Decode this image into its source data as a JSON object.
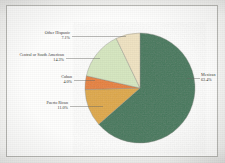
{
  "chart_data": {
    "type": "pie",
    "title": "",
    "subtitle": "",
    "xlabel": "",
    "ylabel": "",
    "legend_position": "none",
    "grid": false,
    "labels_show_percent": true,
    "categories": [
      "Mexican",
      "Puerto Rican",
      "Cuban",
      "Central or South American",
      "Other Hispanic"
    ],
    "values": [
      63.4,
      11.0,
      4.0,
      14.3,
      7.1
    ],
    "value_labels": [
      "63.4%",
      "11.0%",
      "4.0%",
      "14.3%",
      "7.1%"
    ],
    "colors": [
      "#477a5e",
      "#e0aa48",
      "#e8833c",
      "#d7e8c1",
      "#f1e4c3"
    ],
    "slices": [
      {
        "name": "Mexican",
        "value": 63.4,
        "value_label": "63.4%",
        "color": "#477a5e",
        "label_side": "right"
      },
      {
        "name": "Puerto Rican",
        "value": 11.0,
        "value_label": "11.0%",
        "color": "#e0aa48",
        "label_side": "left"
      },
      {
        "name": "Cuban",
        "value": 4.0,
        "value_label": "4.0%",
        "color": "#e8833c",
        "label_side": "left"
      },
      {
        "name": "Central or South American",
        "value": 14.3,
        "value_label": "14.3%",
        "color": "#d7e8c1",
        "label_side": "left"
      },
      {
        "name": "Other Hispanic",
        "value": 7.1,
        "value_label": "7.1%",
        "color": "#f1e4c3",
        "label_side": "left"
      }
    ]
  },
  "figure": {
    "border_color": "#b9b9b5",
    "background_color": "#fefefd",
    "label_text_color": "#3a3a36",
    "leader_line_color": "#6b6b66",
    "slice_outline_color": "#8a8a84"
  },
  "labels": {
    "mexican": {
      "name": "Mexican",
      "pct": "63.4%"
    },
    "puerto_rican": {
      "name": "Puerto Rican",
      "pct": "11.0%"
    },
    "cuban": {
      "name": "Cuban",
      "pct": "4.0%"
    },
    "central_south": {
      "name": "Central or South American",
      "pct": "14.3%"
    },
    "other_hispanic": {
      "name": "Other Hispanic",
      "pct": "7.1%"
    }
  }
}
